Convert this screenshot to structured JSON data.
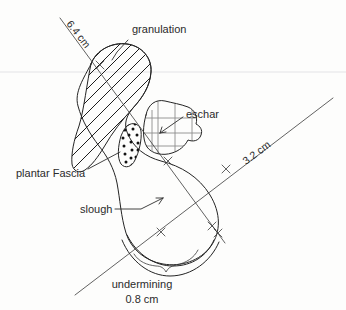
{
  "diagram": {
    "paper": {
      "background_color": "#fdfdfc",
      "ruled_line_color": "#e3e3e6",
      "ink_color": "#242424"
    },
    "measurements": [
      {
        "name": "length",
        "label": "6.4 cm",
        "orientation": "diagonal-down-right",
        "rotation_deg": 52
      },
      {
        "name": "width",
        "label": "3.2 cm",
        "orientation": "diagonal-up-right",
        "rotation_deg": -28
      },
      {
        "name": "undermining-depth",
        "label": "0.8 cm",
        "orientation": "horizontal",
        "rotation_deg": 0
      }
    ],
    "annotations": [
      {
        "name": "granulation",
        "label": "granulation",
        "fill_pattern": "diagonal-hatch",
        "x": 132,
        "y": 33
      },
      {
        "name": "eschar",
        "label": "eschar",
        "fill_pattern": "grid",
        "x": 186,
        "y": 114
      },
      {
        "name": "plantar-fascia",
        "label": "plantar Fascia",
        "fill_pattern": "stipple-dots",
        "x": 18,
        "y": 173
      },
      {
        "name": "slough",
        "label": "slough",
        "fill_pattern": "none",
        "x": 83,
        "y": 211
      },
      {
        "name": "undermining",
        "label": "undermining",
        "fill_pattern": "none",
        "x": 144,
        "y": 286
      }
    ],
    "undermining_value": "0.8 cm"
  }
}
